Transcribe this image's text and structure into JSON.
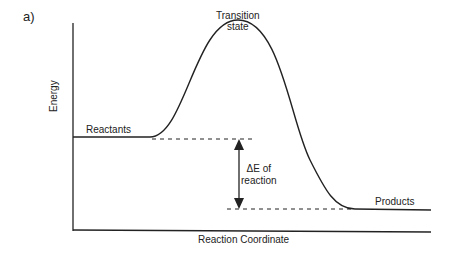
{
  "panel_label": "a)",
  "labels": {
    "transition_state_line1": "Transition",
    "transition_state_line2": "state",
    "reactants": "Reactants",
    "products": "Products",
    "delta_e_line1": "ΔE of",
    "delta_e_line2": "reaction"
  },
  "axes": {
    "xlabel": "Reaction Coordinate",
    "ylabel": "Energy"
  },
  "colors": {
    "line": "#222222",
    "background": "#ffffff"
  }
}
